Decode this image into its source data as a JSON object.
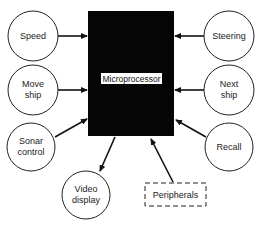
{
  "diagram": {
    "center": {
      "label": "Microprocessor",
      "fill": "#050505"
    },
    "nodes": [
      {
        "id": "speed",
        "lines": [
          "Speed"
        ],
        "shape": "circle",
        "direction": "into-processor"
      },
      {
        "id": "move-ship",
        "lines": [
          "Move",
          "ship"
        ],
        "shape": "circle",
        "direction": "into-processor"
      },
      {
        "id": "sonar-control",
        "lines": [
          "Sonar",
          "control"
        ],
        "shape": "circle",
        "direction": "into-processor"
      },
      {
        "id": "video-display",
        "lines": [
          "Video",
          "display"
        ],
        "shape": "circle",
        "direction": "out-of-processor"
      },
      {
        "id": "steering",
        "lines": [
          "Steering"
        ],
        "shape": "circle",
        "direction": "into-processor"
      },
      {
        "id": "next-ship",
        "lines": [
          "Next",
          "ship"
        ],
        "shape": "circle",
        "direction": "into-processor"
      },
      {
        "id": "recall",
        "lines": [
          "Recall"
        ],
        "shape": "circle",
        "direction": "into-processor"
      },
      {
        "id": "peripherals",
        "lines": [
          "Peripherals"
        ],
        "shape": "dashed-box",
        "direction": "into-processor"
      }
    ]
  }
}
